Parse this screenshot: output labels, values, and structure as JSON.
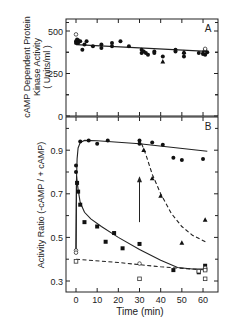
{
  "chart_data": [
    {
      "panel": "A",
      "type": "scatter",
      "panel_label": "A",
      "ylabel": "cAMP Dependent Protein Kinase Activity (Units/ml)",
      "ylabel_lines": [
        "cAMP Dependent Protein",
        "Kinase  Activity",
        "( Units/ml )"
      ],
      "xlabel": "",
      "ylim": [
        0,
        560
      ],
      "xlim": [
        -5,
        65
      ],
      "yticks": [
        0,
        250,
        500
      ],
      "ytick_labels": [
        "0",
        "250",
        "500"
      ],
      "xticks": [
        0,
        10,
        20,
        30,
        40,
        50,
        60
      ],
      "series": [
        {
          "name": "filled circles",
          "marker": "circle-filled",
          "points": [
            [
              0,
              440
            ],
            [
              0,
              430
            ],
            [
              0.5,
              450
            ],
            [
              1,
              445
            ],
            [
              1,
              430
            ],
            [
              2,
              440
            ],
            [
              3,
              390
            ],
            [
              4,
              420
            ],
            [
              5,
              440
            ],
            [
              8,
              410
            ],
            [
              12,
              420
            ],
            [
              12,
              400
            ],
            [
              17,
              430
            ],
            [
              17,
              410
            ],
            [
              21,
              440
            ],
            [
              25,
              410
            ],
            [
              31,
              390
            ],
            [
              31,
              370
            ],
            [
              32,
              380
            ],
            [
              33,
              370
            ],
            [
              34,
              360
            ],
            [
              37,
              380
            ],
            [
              37,
              370
            ],
            [
              41,
              350
            ],
            [
              47,
              390
            ],
            [
              47,
              380
            ],
            [
              51,
              370
            ],
            [
              51,
              350
            ],
            [
              58,
              370
            ],
            [
              60,
              365
            ],
            [
              61,
              390
            ],
            [
              61,
              360
            ],
            [
              62,
              375
            ]
          ]
        },
        {
          "name": "filled triangles",
          "marker": "triangle-filled",
          "points": [
            [
              41,
              320
            ],
            [
              51,
              375
            ],
            [
              60,
              375
            ]
          ]
        },
        {
          "name": "open circles",
          "marker": "circle-open",
          "points": [
            [
              0,
              480
            ],
            [
              61,
              395
            ]
          ]
        }
      ],
      "lines": [
        {
          "style": "solid",
          "points": [
            [
              0,
              420
            ],
            [
              62,
              380
            ]
          ]
        }
      ]
    },
    {
      "panel": "B",
      "type": "scatter",
      "panel_label": "B",
      "ylabel": "Activity Ratio (-cAMP / + cAMP)",
      "xlabel": "Time (min)",
      "ylim": [
        0.25,
        1.05
      ],
      "xlim": [
        -5,
        65
      ],
      "yticks": [
        0.3,
        0.5,
        0.7,
        0.9
      ],
      "ytick_labels": [
        "0.3",
        "0.5",
        "0.7",
        "0.9"
      ],
      "xticks": [
        0,
        10,
        20,
        30,
        40,
        50,
        60
      ],
      "xtick_labels": [
        "0",
        "10",
        "20",
        "30",
        "40",
        "50",
        "60"
      ],
      "series": [
        {
          "name": "filled circles (stimulated, sustained)",
          "marker": "circle-filled",
          "points": [
            [
              0,
              0.83
            ],
            [
              0,
              0.8
            ],
            [
              2,
              0.94
            ],
            [
              6,
              0.945
            ],
            [
              10,
              0.93
            ],
            [
              15,
              0.945
            ],
            [
              30,
              0.945
            ],
            [
              30,
              0.93
            ],
            [
              36,
              0.935
            ],
            [
              41,
              0.925
            ],
            [
              46,
              0.865
            ],
            [
              50,
              0.855
            ],
            [
              60,
              0.86
            ]
          ]
        },
        {
          "name": "filled squares (decay)",
          "marker": "square-filled",
          "points": [
            [
              0.5,
              0.75
            ],
            [
              1,
              0.71
            ],
            [
              2,
              0.65
            ],
            [
              4,
              0.57
            ],
            [
              10,
              0.55
            ],
            [
              14,
              0.48
            ],
            [
              18,
              0.52
            ],
            [
              22,
              0.45
            ],
            [
              30,
              0.47
            ],
            [
              46,
              0.35
            ],
            [
              58,
              0.34
            ],
            [
              61,
              0.37
            ]
          ]
        },
        {
          "name": "filled triangles (re-stimulated at 30 min)",
          "marker": "triangle-filled",
          "points": [
            [
              32,
              0.9
            ],
            [
              36,
              0.77
            ],
            [
              40,
              0.69
            ],
            [
              50,
              0.475
            ],
            [
              61,
              0.58
            ]
          ]
        },
        {
          "name": "open circles",
          "marker": "circle-open",
          "points": [
            [
              0,
              0.44
            ],
            [
              0,
              0.43
            ],
            [
              30,
              0.38
            ],
            [
              61,
              0.36
            ]
          ]
        },
        {
          "name": "open squares (control)",
          "marker": "square-open",
          "points": [
            [
              0,
              0.39
            ],
            [
              30,
              0.31
            ],
            [
              61,
              0.31
            ],
            [
              61,
              0.35
            ],
            [
              58,
              0.345
            ]
          ]
        }
      ],
      "lines": [
        {
          "style": "solid",
          "name": "sustained high",
          "points": [
            [
              0,
              0.44
            ],
            [
              0.2,
              0.75
            ],
            [
              0.5,
              0.86
            ],
            [
              1,
              0.91
            ],
            [
              2,
              0.935
            ],
            [
              4,
              0.945
            ],
            [
              10,
              0.943
            ],
            [
              30,
              0.93
            ],
            [
              62,
              0.895
            ]
          ]
        },
        {
          "name": "decay",
          "style": "solid",
          "points": [
            [
              0,
              0.44
            ],
            [
              0.3,
              0.78
            ],
            [
              1,
              0.72
            ],
            [
              2,
              0.66
            ],
            [
              4,
              0.615
            ],
            [
              7,
              0.585
            ],
            [
              12,
              0.55
            ],
            [
              20,
              0.5
            ],
            [
              30,
              0.445
            ],
            [
              40,
              0.395
            ],
            [
              48,
              0.362
            ],
            [
              55,
              0.355
            ],
            [
              62,
              0.355
            ]
          ]
        },
        {
          "name": "re-stimulation decay",
          "style": "dashed",
          "points": [
            [
              31,
              0.93
            ],
            [
              33,
              0.88
            ],
            [
              36,
              0.79
            ],
            [
              40,
              0.7
            ],
            [
              45,
              0.61
            ],
            [
              50,
              0.55
            ],
            [
              55,
              0.51
            ],
            [
              62,
              0.475
            ]
          ]
        },
        {
          "name": "control",
          "style": "dashed",
          "points": [
            [
              0,
              0.4
            ],
            [
              20,
              0.385
            ],
            [
              40,
              0.365
            ],
            [
              62,
              0.35
            ]
          ]
        }
      ],
      "annotations": [
        {
          "type": "arrow",
          "from": [
            30,
            0.57
          ],
          "to": [
            30,
            0.78
          ]
        }
      ]
    }
  ],
  "figure": {
    "xlabel": "Time  (min)"
  }
}
